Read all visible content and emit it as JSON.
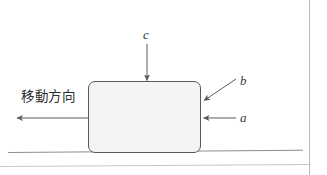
{
  "figure": {
    "type": "free-body-diagram",
    "title": "",
    "background_color": "#ffffff",
    "block": {
      "name": "block",
      "fill_color": "#f4f4f4",
      "stroke_color": "#58595b",
      "x": 88,
      "y": 81,
      "width": 113,
      "height": 72,
      "corner_radius": 7
    },
    "ground": {
      "name": "ground-line",
      "color": "#8d8d8d",
      "x1": 8,
      "y1": 152,
      "x2": 303,
      "y2": 150
    },
    "labels": {
      "c": "c",
      "b": "b",
      "a": "a",
      "direction_of_motion": "移動方向"
    },
    "arrows": [
      {
        "id": "c",
        "label": "c",
        "description": "downward arrow onto top of block",
        "x1": 147,
        "y1": 44,
        "x2": 147,
        "y2": 81,
        "color": "#5a5a5a"
      },
      {
        "id": "b",
        "label": "b",
        "description": "diagonal leader arrow to upper right edge of block",
        "x1": 236,
        "y1": 79,
        "x2": 203,
        "y2": 101,
        "color": "#5a5a5a"
      },
      {
        "id": "a",
        "label": "a",
        "description": "horizontal arrow pointing left into right side of block",
        "x1": 236,
        "y1": 118,
        "x2": 203,
        "y2": 118,
        "color": "#5a5a5a"
      },
      {
        "id": "motion",
        "label": "移動方向",
        "description": "horizontal arrow pointing left away from block",
        "x1": 88,
        "y1": 118,
        "x2": 17,
        "y2": 118,
        "color": "#5a5a5a"
      }
    ],
    "scan_edges": {
      "right_border_color": "#b9b9b9",
      "bottom_border_color": "#c6c6c6"
    }
  }
}
